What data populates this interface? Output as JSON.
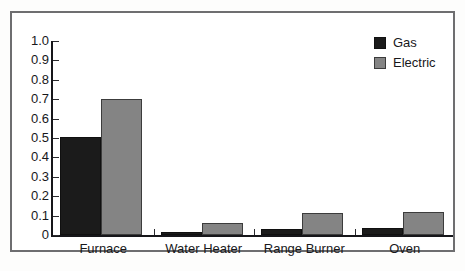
{
  "chart_data": {
    "type": "bar",
    "title": "",
    "xlabel": "",
    "ylabel": "",
    "categories": [
      "Furnace",
      "Water Heater",
      "Range Burner",
      "Oven"
    ],
    "series": [
      {
        "name": "Gas",
        "color": "#1b1b1b",
        "values": [
          0.505,
          0.015,
          0.03,
          0.035
        ]
      },
      {
        "name": "Electric",
        "color": "#848484",
        "values": [
          0.7,
          0.06,
          0.115,
          0.12
        ]
      }
    ],
    "ylim": [
      0,
      1.0
    ],
    "ytick_labels": [
      "1.0",
      "0.9",
      "0.8",
      "0.7",
      "0.6",
      "0.5",
      "0.4",
      "0.3",
      "0.2",
      "0.1",
      "0"
    ],
    "ytick_values": [
      1.0,
      0.9,
      0.8,
      0.7,
      0.6,
      0.5,
      0.4,
      0.3,
      0.2,
      0.1,
      0
    ],
    "grid": false,
    "legend_position": "top-right"
  },
  "legend": {
    "entries": [
      {
        "label": "Gas"
      },
      {
        "label": "Electric"
      }
    ]
  },
  "caption": {
    "partial_text": ""
  }
}
